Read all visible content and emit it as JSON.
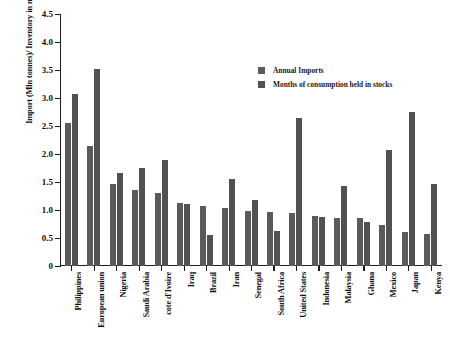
{
  "chart_data": {
    "type": "bar",
    "title": "",
    "xlabel": "",
    "ylabel": "Import (Mln tonnes)/ Inventory in months of normal use",
    "ylim": [
      0,
      4.5
    ],
    "ytick_labels": [
      "0",
      "0.5",
      "1.0",
      "1.5",
      "2.0",
      "2.5",
      "3.0",
      "3.5",
      "4.0",
      "4.5"
    ],
    "ytick_values": [
      0,
      0.5,
      1.0,
      1.5,
      2.0,
      2.5,
      3.0,
      3.5,
      4.0,
      4.5
    ],
    "grid": false,
    "legend_position": "top-right-inside",
    "categories": [
      "Philippines",
      "European union",
      "Nigeria",
      "Saudi Arabia",
      "cote d'Ivoire",
      "Iraq",
      "Brazil",
      "Iran",
      "Senegal",
      "South Africa",
      "United States",
      "Indonesia",
      "Malaysia",
      "Ghana",
      "Mexico",
      "Japan",
      "Kenya"
    ],
    "series": [
      {
        "name": "Annual Imports",
        "color": "#5a5a5a",
        "values": [
          2.55,
          2.15,
          1.47,
          1.36,
          1.3,
          1.13,
          1.07,
          1.04,
          0.99,
          0.96,
          0.95,
          0.9,
          0.85,
          0.85,
          0.74,
          0.6,
          0.58
        ]
      },
      {
        "name": "Months of consumption held in stocks",
        "color": "#515151",
        "values": [
          3.07,
          3.51,
          1.66,
          1.75,
          1.89,
          1.1,
          0.55,
          1.55,
          1.18,
          0.63,
          2.65,
          0.88,
          1.42,
          0.79,
          2.07,
          2.75,
          1.46
        ]
      }
    ]
  },
  "legend": {
    "items": [
      {
        "label": "Annual Imports",
        "color": "#5a5a5a"
      },
      {
        "label": "Months of consumption held in stocks",
        "color": "#515151"
      }
    ]
  },
  "colors": {
    "series_1": "#5a5a5a",
    "series_2": "#515151",
    "axis": "#1c1c1c",
    "background": "#ffffff"
  }
}
